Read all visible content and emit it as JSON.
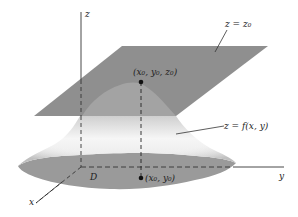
{
  "diagram": {
    "axes": {
      "x_label": "x",
      "y_label": "y",
      "z_label": "z"
    },
    "labels": {
      "plane": "z = z₀",
      "surface": "z = f(x, y)",
      "top_point": "(x₀, y₀, z₀)",
      "base_point": "(x₀, y₀)",
      "domain": "D"
    },
    "colors": {
      "plane": "#8f8f8f",
      "surface_light": "#f4f4f4",
      "surface_shadow": "#b5b5b5",
      "domain_fill": "#9a9a9a",
      "axis": "#333333",
      "point": "#111111",
      "background": "#ffffff"
    }
  }
}
